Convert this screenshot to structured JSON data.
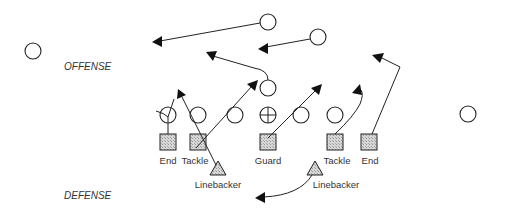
{
  "labels": {
    "offense": "OFFENSE",
    "defense": "DEFENSE"
  },
  "defense_line": {
    "positions": [
      "End",
      "Tackle",
      "Guard",
      "Tackle",
      "End"
    ],
    "linebackers": [
      "Linebacker",
      "Linebacker"
    ]
  },
  "colors": {
    "stroke": "#222222",
    "fill_shade": "#c8c8c8",
    "background": "#ffffff",
    "text": "#333333"
  },
  "legend": {
    "offense_symbol": "circle",
    "center_symbol": "circle-with-cross",
    "defensive_lineman_symbol": "shaded-square",
    "linebacker_symbol": "shaded-triangle"
  }
}
